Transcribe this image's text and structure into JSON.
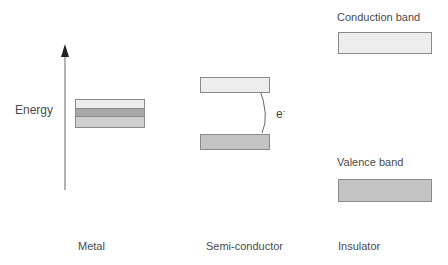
{
  "diagram": {
    "axis_label": "Energy",
    "electron_label": "e",
    "electron_superscript": "-",
    "columns": [
      {
        "label": "Metal"
      },
      {
        "label": "Semi-conductor"
      },
      {
        "label": "Insulator"
      }
    ],
    "insulator_labels": {
      "conduction": "Conduction band",
      "valence": "Valence band"
    },
    "colors": {
      "light_band": "#ededed",
      "dark_band": "#a8a8a8",
      "medium_band": "#cfcfcf",
      "outline": "#8a8a8a",
      "text": "#4a4a4a"
    }
  }
}
